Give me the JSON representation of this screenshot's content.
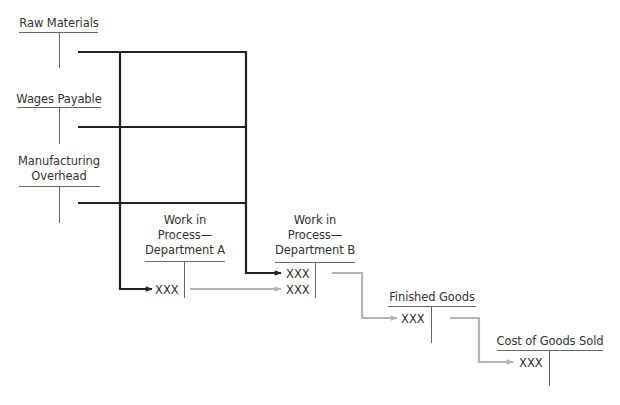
{
  "colors": {
    "ink": "#222222",
    "text": "#333333",
    "flow_gray": "#b3b3b3",
    "t_account_line": "#555555"
  },
  "accounts": {
    "raw_materials": {
      "title": "Raw Materials"
    },
    "wages_payable": {
      "title": "Wages Payable"
    },
    "manufacturing_overhead": {
      "title_line1": "Manufacturing",
      "title_line2": "Overhead"
    },
    "wip_a": {
      "title_line1": "Work in",
      "title_line2": "Process—",
      "title_line3": "Department A",
      "debit": "XXX"
    },
    "wip_b": {
      "title_line1": "Work in",
      "title_line2": "Process—",
      "title_line3": "Department B",
      "debit_1": "XXX",
      "debit_2": "XXX"
    },
    "finished_goods": {
      "title": "Finished Goods",
      "debit": "XXX"
    },
    "cogs": {
      "title": "Cost of Goods Sold",
      "debit": "XXX"
    }
  }
}
